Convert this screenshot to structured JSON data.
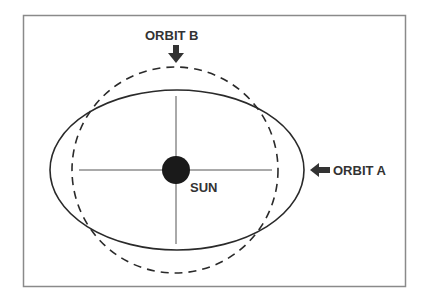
{
  "diagram": {
    "frame": {
      "x": 23,
      "y": 15,
      "width": 382,
      "height": 271,
      "stroke": "#8a8a8a"
    },
    "sun": {
      "label": "SUN",
      "cx": 176,
      "cy": 170,
      "r": 14,
      "fill": "#1a1a1a"
    },
    "orbit_a": {
      "label": "ORBIT A",
      "type": "ellipse",
      "style": "solid",
      "cx": 177,
      "cy": 170,
      "rx": 127,
      "ry": 80
    },
    "orbit_b": {
      "label": "ORBIT B",
      "type": "circle",
      "style": "dashed",
      "cx": 175,
      "cy": 170,
      "r": 103
    },
    "axes": {
      "horizontal": {
        "x1": 79,
        "x2": 272,
        "y": 170
      },
      "vertical": {
        "x": 176,
        "y1": 96,
        "y2": 244
      }
    },
    "colors": {
      "line": "#333333",
      "text": "#333333"
    }
  }
}
